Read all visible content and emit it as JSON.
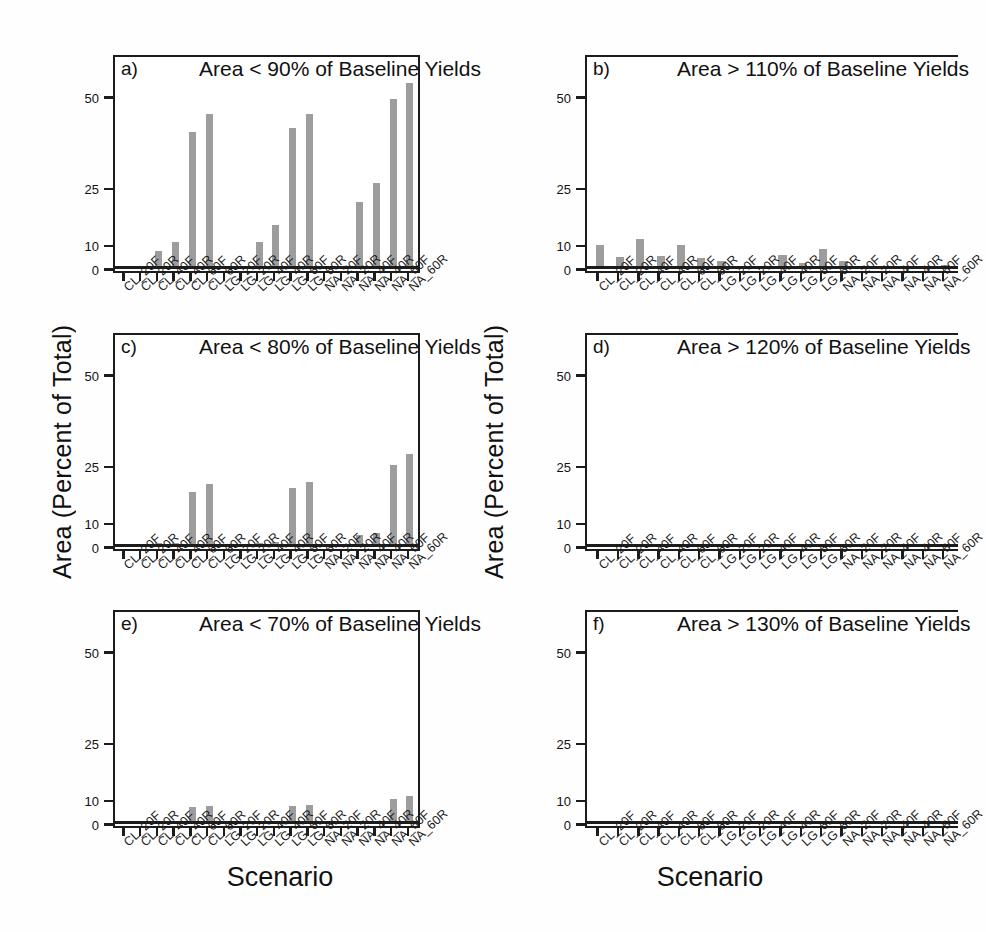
{
  "figure": {
    "y_axis_title": "Area (Percent of Total)",
    "x_axis_title": "Scenario",
    "bar_color": "#9d9d9d",
    "axis_color": "#1c1c1c"
  },
  "axis": {
    "y_ticks": [
      0,
      10,
      25,
      50
    ],
    "y_tick_labels": [
      "0",
      "10",
      "25",
      "50"
    ],
    "y_min": 0,
    "y_max": 57,
    "categories": [
      "CL_20F",
      "CL_20R",
      "CL_40F",
      "CL_40R",
      "CL_60F",
      "CL_60R",
      "LG_20F",
      "LG_20R",
      "LG_40F",
      "LG_40R",
      "LG_60F",
      "LG_60R",
      "NA_20F",
      "NA_20R",
      "NA_40F",
      "NA_40R",
      "NA_60F",
      "NA_60R"
    ]
  },
  "chart_data": [
    {
      "type": "bar",
      "panel": "a",
      "letter": "a)",
      "title": "Area < 90% of Baseline Yields",
      "xlabel": "Scenario",
      "ylabel": "Area (Percent of Total)",
      "ylim": [
        0,
        57
      ],
      "yticks": [
        0,
        10,
        25,
        50
      ],
      "grid": false,
      "legend": "none",
      "categories": [
        "CL_20F",
        "CL_20R",
        "CL_40F",
        "CL_40R",
        "CL_60F",
        "CL_60R",
        "LG_20F",
        "LG_20R",
        "LG_40F",
        "LG_40R",
        "LG_60F",
        "LG_60R",
        "NA_20F",
        "NA_20R",
        "NA_40F",
        "NA_40R",
        "NA_60F",
        "NA_60R"
      ],
      "values": [
        0,
        0,
        7,
        10.5,
        40,
        45,
        0,
        0.6,
        10.5,
        15,
        41,
        45,
        0,
        0,
        21,
        26,
        49,
        53
      ]
    },
    {
      "type": "bar",
      "panel": "b",
      "letter": "b)",
      "title": "Area > 110% of Baseline Yields",
      "xlabel": "Scenario",
      "ylabel": "Area (Percent of Total)",
      "ylim": [
        0,
        57
      ],
      "yticks": [
        0,
        10,
        25,
        50
      ],
      "grid": false,
      "legend": "none",
      "categories": [
        "CL_20F",
        "CL_20R",
        "CL_40F",
        "CL_40R",
        "CL_60F",
        "CL_60R",
        "LG_20F",
        "LG_20R",
        "LG_40F",
        "LG_40R",
        "LG_60F",
        "LG_60R",
        "NA_20F",
        "NA_20R",
        "NA_40F",
        "NA_40R",
        "NA_60F",
        "NA_60R"
      ],
      "values": [
        9.3,
        4.6,
        11.2,
        4.8,
        9.3,
        4.0,
        2.8,
        0.7,
        0.2,
        5.5,
        1.9,
        7.8,
        3.0,
        0.5,
        0.4,
        0.5,
        0.4,
        1.3
      ]
    },
    {
      "type": "bar",
      "panel": "c",
      "letter": "c)",
      "title": "Area < 80% of Baseline Yields",
      "xlabel": "Scenario",
      "ylabel": "Area (Percent of Total)",
      "ylim": [
        0,
        57
      ],
      "yticks": [
        0,
        10,
        25,
        50
      ],
      "grid": false,
      "legend": "none",
      "categories": [
        "CL_20F",
        "CL_20R",
        "CL_40F",
        "CL_40R",
        "CL_60F",
        "CL_60R",
        "LG_20F",
        "LG_20R",
        "LG_40F",
        "LG_40R",
        "LG_60F",
        "LG_60R",
        "NA_20F",
        "NA_20R",
        "NA_40F",
        "NA_40R",
        "NA_60F",
        "NA_60R"
      ],
      "values": [
        0,
        0,
        1.2,
        1.3,
        18,
        20,
        0,
        0,
        1.3,
        1.4,
        19,
        20.5,
        0,
        0,
        4.5,
        5.5,
        25,
        28
      ]
    },
    {
      "type": "bar",
      "panel": "d",
      "letter": "d)",
      "title": "Area > 120% of Baseline Yields",
      "xlabel": "Scenario",
      "ylabel": "Area (Percent of Total)",
      "ylim": [
        0,
        57
      ],
      "yticks": [
        0,
        10,
        25,
        50
      ],
      "grid": false,
      "legend": "none",
      "categories": [
        "CL_20F",
        "CL_20R",
        "CL_40F",
        "CL_40R",
        "CL_60F",
        "CL_60R",
        "LG_20F",
        "LG_20R",
        "LG_40F",
        "LG_40R",
        "LG_60F",
        "LG_60R",
        "NA_20F",
        "NA_20R",
        "NA_40F",
        "NA_40R",
        "NA_60F",
        "NA_60R"
      ],
      "values": [
        0.5,
        0.4,
        0.6,
        0.4,
        0.5,
        0.3,
        0.3,
        0.2,
        0.2,
        0.4,
        0.3,
        0.6,
        0.7,
        0.3,
        0.3,
        0.3,
        0.4,
        0.7
      ]
    },
    {
      "type": "bar",
      "panel": "e",
      "letter": "e)",
      "title": "Area < 70% of Baseline Yields",
      "xlabel": "Scenario",
      "ylabel": "Area (Percent of Total)",
      "ylim": [
        0,
        57
      ],
      "yticks": [
        0,
        10,
        25,
        50
      ],
      "grid": false,
      "legend": "none",
      "categories": [
        "CL_20F",
        "CL_20R",
        "CL_40F",
        "CL_40R",
        "CL_60F",
        "CL_60R",
        "LG_20F",
        "LG_20R",
        "LG_40F",
        "LG_40R",
        "LG_60F",
        "LG_60R",
        "NA_20F",
        "NA_20R",
        "NA_40F",
        "NA_40R",
        "NA_60F",
        "NA_60R"
      ],
      "values": [
        0,
        0,
        0,
        0.2,
        6.5,
        7.0,
        0,
        0,
        0.2,
        0.3,
        6.8,
        7.3,
        0,
        0,
        0.5,
        0.6,
        10.0,
        10.8
      ]
    },
    {
      "type": "bar",
      "panel": "f",
      "letter": "f)",
      "title": "Area > 130% of Baseline Yields",
      "xlabel": "Scenario",
      "ylabel": "Area (Percent of Total)",
      "ylim": [
        0,
        57
      ],
      "yticks": [
        0,
        10,
        25,
        50
      ],
      "grid": false,
      "legend": "none",
      "categories": [
        "CL_20F",
        "CL_20R",
        "CL_40F",
        "CL_40R",
        "CL_60F",
        "CL_60R",
        "LG_20F",
        "LG_20R",
        "LG_40F",
        "LG_40R",
        "LG_60F",
        "LG_60R",
        "NA_20F",
        "NA_20R",
        "NA_40F",
        "NA_40R",
        "NA_60F",
        "NA_60R"
      ],
      "values": [
        0.2,
        0.15,
        0.2,
        0.15,
        0.3,
        0.3,
        0.2,
        0.15,
        0.2,
        0.2,
        0.35,
        0.4,
        0.2,
        0.15,
        0.15,
        0.15,
        0.15,
        0.2
      ]
    }
  ]
}
